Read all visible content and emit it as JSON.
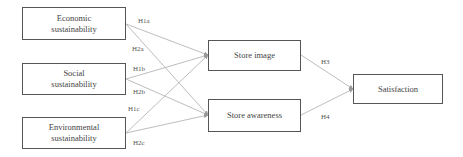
{
  "diagram": {
    "nodes": [
      {
        "id": "economic",
        "label_line1": "Economic",
        "label_line2": "sustainability"
      },
      {
        "id": "social",
        "label_line1": "Social",
        "label_line2": "sustainability"
      },
      {
        "id": "environmental",
        "label_line1": "Environmental",
        "label_line2": "sustainability"
      },
      {
        "id": "store_image",
        "label": "Store image"
      },
      {
        "id": "store_awareness",
        "label": "Store awareness"
      },
      {
        "id": "satisfaction",
        "label": "Satisfaction"
      }
    ],
    "edges": [
      {
        "from": "economic",
        "to": "store_image",
        "label": "H1a"
      },
      {
        "from": "economic",
        "to": "store_awareness",
        "label": "H2a"
      },
      {
        "from": "social",
        "to": "store_image",
        "label": "H1b"
      },
      {
        "from": "social",
        "to": "store_awareness",
        "label": "H2b"
      },
      {
        "from": "environmental",
        "to": "store_image",
        "label": "H1c"
      },
      {
        "from": "environmental",
        "to": "store_awareness",
        "label": "H2c"
      },
      {
        "from": "store_image",
        "to": "satisfaction",
        "label": "H3"
      },
      {
        "from": "store_awareness",
        "to": "satisfaction",
        "label": "H4"
      }
    ],
    "colors": {
      "border": "#555555",
      "edge": "#b5b5b5",
      "text": "#444444"
    }
  }
}
